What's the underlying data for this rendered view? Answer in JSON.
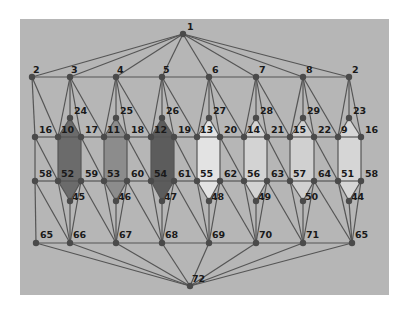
{
  "diagram": {
    "type": "planar-graph",
    "background": {
      "x": 20,
      "y": 19,
      "width": 369,
      "height": 276,
      "color": "#b6b6b6"
    },
    "edge_color": "#555555",
    "node_color": "#4a4a4a",
    "node_radius": 3.2,
    "nodes": [
      {
        "id": "n1",
        "label": "1",
        "x": 183,
        "y": 34,
        "lx": 4,
        "ly": -4
      },
      {
        "id": "n2a",
        "label": "2",
        "x": 32,
        "y": 77,
        "lx": 1,
        "ly": -4
      },
      {
        "id": "n3",
        "label": "3",
        "x": 70,
        "y": 77,
        "lx": 1,
        "ly": -4
      },
      {
        "id": "n4",
        "label": "4",
        "x": 116,
        "y": 77,
        "lx": 1,
        "ly": -4
      },
      {
        "id": "n5",
        "label": "5",
        "x": 162,
        "y": 77,
        "lx": 1,
        "ly": -4
      },
      {
        "id": "n6",
        "label": "6",
        "x": 209,
        "y": 77,
        "lx": 3,
        "ly": -4
      },
      {
        "id": "n7",
        "label": "7",
        "x": 256,
        "y": 77,
        "lx": 3,
        "ly": -4
      },
      {
        "id": "n8",
        "label": "8",
        "x": 303,
        "y": 77,
        "lx": 3,
        "ly": -4
      },
      {
        "id": "n2b",
        "label": "2",
        "x": 349,
        "y": 77,
        "lx": 3,
        "ly": -4
      },
      {
        "id": "n24",
        "label": "24",
        "x": 70,
        "y": 118,
        "lx": 4,
        "ly": -4
      },
      {
        "id": "n25",
        "label": "25",
        "x": 116,
        "y": 118,
        "lx": 4,
        "ly": -4
      },
      {
        "id": "n26",
        "label": "26",
        "x": 162,
        "y": 118,
        "lx": 4,
        "ly": -4
      },
      {
        "id": "n27",
        "label": "27",
        "x": 209,
        "y": 118,
        "lx": 4,
        "ly": -4
      },
      {
        "id": "n28",
        "label": "28",
        "x": 256,
        "y": 118,
        "lx": 4,
        "ly": -4
      },
      {
        "id": "n29",
        "label": "29",
        "x": 303,
        "y": 118,
        "lx": 4,
        "ly": -4
      },
      {
        "id": "n23",
        "label": "23",
        "x": 349,
        "y": 118,
        "lx": 4,
        "ly": -4
      },
      {
        "id": "n16a",
        "label": "16",
        "x": 35,
        "y": 137,
        "lx": 4,
        "ly": -4
      },
      {
        "id": "n10",
        "label": "10",
        "x": 58,
        "y": 137,
        "lx": 3,
        "ly": -4
      },
      {
        "id": "n17",
        "label": "17",
        "x": 81,
        "y": 137,
        "lx": 4,
        "ly": -4
      },
      {
        "id": "n11",
        "label": "11",
        "x": 104,
        "y": 137,
        "lx": 3,
        "ly": -4
      },
      {
        "id": "n18",
        "label": "18",
        "x": 127,
        "y": 137,
        "lx": 4,
        "ly": -4
      },
      {
        "id": "n12",
        "label": "12",
        "x": 151,
        "y": 137,
        "lx": 3,
        "ly": -4
      },
      {
        "id": "n19",
        "label": "19",
        "x": 174,
        "y": 137,
        "lx": 4,
        "ly": -4
      },
      {
        "id": "n13",
        "label": "13",
        "x": 197,
        "y": 137,
        "lx": 3,
        "ly": -4
      },
      {
        "id": "n20",
        "label": "20",
        "x": 220,
        "y": 137,
        "lx": 4,
        "ly": -4
      },
      {
        "id": "n14",
        "label": "14",
        "x": 244,
        "y": 137,
        "lx": 3,
        "ly": -4
      },
      {
        "id": "n21",
        "label": "21",
        "x": 267,
        "y": 137,
        "lx": 4,
        "ly": -4
      },
      {
        "id": "n15",
        "label": "15",
        "x": 290,
        "y": 137,
        "lx": 3,
        "ly": -4
      },
      {
        "id": "n22",
        "label": "22",
        "x": 314,
        "y": 137,
        "lx": 4,
        "ly": -4
      },
      {
        "id": "n9",
        "label": "9",
        "x": 338,
        "y": 137,
        "lx": 3,
        "ly": -4
      },
      {
        "id": "n16b",
        "label": "16",
        "x": 361,
        "y": 137,
        "lx": 4,
        "ly": -4
      },
      {
        "id": "n58a",
        "label": "58",
        "x": 35,
        "y": 181,
        "lx": 4,
        "ly": -4
      },
      {
        "id": "n52",
        "label": "52",
        "x": 58,
        "y": 181,
        "lx": 3,
        "ly": -4
      },
      {
        "id": "n59",
        "label": "59",
        "x": 81,
        "y": 181,
        "lx": 4,
        "ly": -4
      },
      {
        "id": "n53",
        "label": "53",
        "x": 104,
        "y": 181,
        "lx": 3,
        "ly": -4
      },
      {
        "id": "n60",
        "label": "60",
        "x": 127,
        "y": 181,
        "lx": 4,
        "ly": -4
      },
      {
        "id": "n54",
        "label": "54",
        "x": 151,
        "y": 181,
        "lx": 3,
        "ly": -4
      },
      {
        "id": "n61",
        "label": "61",
        "x": 174,
        "y": 181,
        "lx": 4,
        "ly": -4
      },
      {
        "id": "n55",
        "label": "55",
        "x": 197,
        "y": 181,
        "lx": 3,
        "ly": -4
      },
      {
        "id": "n62",
        "label": "62",
        "x": 220,
        "y": 181,
        "lx": 4,
        "ly": -4
      },
      {
        "id": "n56",
        "label": "56",
        "x": 244,
        "y": 181,
        "lx": 3,
        "ly": -4
      },
      {
        "id": "n63",
        "label": "63",
        "x": 267,
        "y": 181,
        "lx": 4,
        "ly": -4
      },
      {
        "id": "n57",
        "label": "57",
        "x": 290,
        "y": 181,
        "lx": 3,
        "ly": -4
      },
      {
        "id": "n64",
        "label": "64",
        "x": 314,
        "y": 181,
        "lx": 4,
        "ly": -4
      },
      {
        "id": "n51",
        "label": "51",
        "x": 338,
        "y": 181,
        "lx": 3,
        "ly": -4
      },
      {
        "id": "n58b",
        "label": "58",
        "x": 361,
        "y": 181,
        "lx": 4,
        "ly": -4
      },
      {
        "id": "n45",
        "label": "45",
        "x": 70,
        "y": 201,
        "lx": 2,
        "ly": -1
      },
      {
        "id": "n46",
        "label": "46",
        "x": 116,
        "y": 201,
        "lx": 2,
        "ly": -1
      },
      {
        "id": "n47",
        "label": "47",
        "x": 162,
        "y": 201,
        "lx": 2,
        "ly": -1
      },
      {
        "id": "n48",
        "label": "48",
        "x": 209,
        "y": 201,
        "lx": 2,
        "ly": -1
      },
      {
        "id": "n49",
        "label": "49",
        "x": 256,
        "y": 201,
        "lx": 2,
        "ly": -1
      },
      {
        "id": "n50",
        "label": "50",
        "x": 303,
        "y": 201,
        "lx": 2,
        "ly": -1
      },
      {
        "id": "n44",
        "label": "44",
        "x": 349,
        "y": 201,
        "lx": 2,
        "ly": -1
      },
      {
        "id": "n65a",
        "label": "65",
        "x": 36,
        "y": 243,
        "lx": 4,
        "ly": -5
      },
      {
        "id": "n66",
        "label": "66",
        "x": 70,
        "y": 243,
        "lx": 3,
        "ly": -5
      },
      {
        "id": "n67",
        "label": "67",
        "x": 116,
        "y": 243,
        "lx": 3,
        "ly": -5
      },
      {
        "id": "n68",
        "label": "68",
        "x": 162,
        "y": 243,
        "lx": 3,
        "ly": -5
      },
      {
        "id": "n69",
        "label": "69",
        "x": 209,
        "y": 243,
        "lx": 3,
        "ly": -5
      },
      {
        "id": "n70",
        "label": "70",
        "x": 256,
        "y": 243,
        "lx": 3,
        "ly": -5
      },
      {
        "id": "n71",
        "label": "71",
        "x": 303,
        "y": 243,
        "lx": 3,
        "ly": -5
      },
      {
        "id": "n65b",
        "label": "65",
        "x": 352,
        "y": 243,
        "lx": 3,
        "ly": -5
      },
      {
        "id": "n72",
        "label": "72",
        "x": 190,
        "y": 286,
        "lx": 2,
        "ly": -4
      }
    ],
    "faces": [
      {
        "label": "face-10-24-17-59-45-52",
        "color": "#6b6b6b",
        "nodes": [
          "n10",
          "n24",
          "n17",
          "n59",
          "n45",
          "n52"
        ]
      },
      {
        "label": "face-11-25-18-60-46-53",
        "color": "#8c8c8c",
        "nodes": [
          "n11",
          "n25",
          "n18",
          "n60",
          "n46",
          "n53"
        ]
      },
      {
        "label": "face-12-26-19-61-47-54",
        "color": "#5c5c5c",
        "nodes": [
          "n12",
          "n26",
          "n19",
          "n61",
          "n47",
          "n54"
        ]
      },
      {
        "label": "face-13-27-20-62-48-55",
        "color": "#e3e3e3",
        "nodes": [
          "n13",
          "n27",
          "n20",
          "n62",
          "n48",
          "n55"
        ]
      },
      {
        "label": "face-14-28-21-63-49-56",
        "color": "#d3d3d3",
        "nodes": [
          "n14",
          "n28",
          "n21",
          "n63",
          "n49",
          "n56"
        ]
      },
      {
        "label": "face-15-29-22-64-50-57",
        "color": "#d0d0d0",
        "nodes": [
          "n15",
          "n29",
          "n22",
          "n64",
          "n50",
          "n57"
        ]
      },
      {
        "label": "face-9-23-16-58-44-51",
        "color": "#d6d6d6",
        "nodes": [
          "n9",
          "n23",
          "n16b",
          "n58b",
          "n44",
          "n51"
        ]
      }
    ],
    "edges": [
      [
        "n1",
        "n2a"
      ],
      [
        "n1",
        "n3"
      ],
      [
        "n1",
        "n4"
      ],
      [
        "n1",
        "n5"
      ],
      [
        "n1",
        "n6"
      ],
      [
        "n1",
        "n7"
      ],
      [
        "n1",
        "n8"
      ],
      [
        "n1",
        "n2b"
      ],
      [
        "n2a",
        "n3"
      ],
      [
        "n3",
        "n4"
      ],
      [
        "n4",
        "n5"
      ],
      [
        "n5",
        "n6"
      ],
      [
        "n6",
        "n7"
      ],
      [
        "n7",
        "n8"
      ],
      [
        "n8",
        "n2b"
      ],
      [
        "n2a",
        "n16a"
      ],
      [
        "n2a",
        "n10"
      ],
      [
        "n3",
        "n10"
      ],
      [
        "n3",
        "n24"
      ],
      [
        "n3",
        "n17"
      ],
      [
        "n3",
        "n11"
      ],
      [
        "n4",
        "n11"
      ],
      [
        "n4",
        "n25"
      ],
      [
        "n4",
        "n18"
      ],
      [
        "n4",
        "n12"
      ],
      [
        "n5",
        "n12"
      ],
      [
        "n5",
        "n26"
      ],
      [
        "n5",
        "n19"
      ],
      [
        "n5",
        "n13"
      ],
      [
        "n6",
        "n13"
      ],
      [
        "n6",
        "n27"
      ],
      [
        "n6",
        "n20"
      ],
      [
        "n6",
        "n14"
      ],
      [
        "n7",
        "n14"
      ],
      [
        "n7",
        "n28"
      ],
      [
        "n7",
        "n21"
      ],
      [
        "n7",
        "n15"
      ],
      [
        "n8",
        "n15"
      ],
      [
        "n8",
        "n29"
      ],
      [
        "n8",
        "n22"
      ],
      [
        "n8",
        "n9"
      ],
      [
        "n2b",
        "n9"
      ],
      [
        "n2b",
        "n23"
      ],
      [
        "n2b",
        "n16b"
      ],
      [
        "n24",
        "n10"
      ],
      [
        "n24",
        "n17"
      ],
      [
        "n25",
        "n11"
      ],
      [
        "n25",
        "n18"
      ],
      [
        "n26",
        "n12"
      ],
      [
        "n26",
        "n19"
      ],
      [
        "n27",
        "n13"
      ],
      [
        "n27",
        "n20"
      ],
      [
        "n28",
        "n14"
      ],
      [
        "n28",
        "n21"
      ],
      [
        "n29",
        "n15"
      ],
      [
        "n29",
        "n22"
      ],
      [
        "n23",
        "n9"
      ],
      [
        "n23",
        "n16b"
      ],
      [
        "n16a",
        "n10"
      ],
      [
        "n10",
        "n17"
      ],
      [
        "n17",
        "n11"
      ],
      [
        "n11",
        "n18"
      ],
      [
        "n18",
        "n12"
      ],
      [
        "n12",
        "n19"
      ],
      [
        "n19",
        "n13"
      ],
      [
        "n13",
        "n20"
      ],
      [
        "n20",
        "n14"
      ],
      [
        "n14",
        "n21"
      ],
      [
        "n21",
        "n15"
      ],
      [
        "n15",
        "n22"
      ],
      [
        "n22",
        "n9"
      ],
      [
        "n9",
        "n16b"
      ],
      [
        "n16a",
        "n58a"
      ],
      [
        "n10",
        "n52"
      ],
      [
        "n17",
        "n59"
      ],
      [
        "n11",
        "n53"
      ],
      [
        "n18",
        "n60"
      ],
      [
        "n12",
        "n54"
      ],
      [
        "n19",
        "n61"
      ],
      [
        "n13",
        "n55"
      ],
      [
        "n20",
        "n62"
      ],
      [
        "n14",
        "n56"
      ],
      [
        "n21",
        "n63"
      ],
      [
        "n15",
        "n57"
      ],
      [
        "n22",
        "n64"
      ],
      [
        "n9",
        "n51"
      ],
      [
        "n16b",
        "n58b"
      ],
      [
        "n16a",
        "n52"
      ],
      [
        "n17",
        "n53"
      ],
      [
        "n18",
        "n54"
      ],
      [
        "n19",
        "n55"
      ],
      [
        "n20",
        "n56"
      ],
      [
        "n21",
        "n57"
      ],
      [
        "n22",
        "n51"
      ],
      [
        "n58a",
        "n52"
      ],
      [
        "n52",
        "n59"
      ],
      [
        "n59",
        "n53"
      ],
      [
        "n53",
        "n60"
      ],
      [
        "n60",
        "n54"
      ],
      [
        "n54",
        "n61"
      ],
      [
        "n61",
        "n55"
      ],
      [
        "n55",
        "n62"
      ],
      [
        "n62",
        "n56"
      ],
      [
        "n56",
        "n63"
      ],
      [
        "n63",
        "n57"
      ],
      [
        "n57",
        "n64"
      ],
      [
        "n64",
        "n51"
      ],
      [
        "n51",
        "n58b"
      ],
      [
        "n52",
        "n45"
      ],
      [
        "n59",
        "n45"
      ],
      [
        "n53",
        "n46"
      ],
      [
        "n60",
        "n46"
      ],
      [
        "n54",
        "n47"
      ],
      [
        "n61",
        "n47"
      ],
      [
        "n55",
        "n48"
      ],
      [
        "n62",
        "n48"
      ],
      [
        "n56",
        "n49"
      ],
      [
        "n63",
        "n49"
      ],
      [
        "n57",
        "n50"
      ],
      [
        "n64",
        "n50"
      ],
      [
        "n51",
        "n44"
      ],
      [
        "n58b",
        "n44"
      ],
      [
        "n58a",
        "n65a"
      ],
      [
        "n58a",
        "n66"
      ],
      [
        "n52",
        "n66"
      ],
      [
        "n45",
        "n66"
      ],
      [
        "n59",
        "n66"
      ],
      [
        "n59",
        "n67"
      ],
      [
        "n53",
        "n67"
      ],
      [
        "n46",
        "n67"
      ],
      [
        "n60",
        "n67"
      ],
      [
        "n60",
        "n68"
      ],
      [
        "n54",
        "n68"
      ],
      [
        "n47",
        "n68"
      ],
      [
        "n61",
        "n68"
      ],
      [
        "n61",
        "n69"
      ],
      [
        "n55",
        "n69"
      ],
      [
        "n48",
        "n69"
      ],
      [
        "n62",
        "n69"
      ],
      [
        "n62",
        "n70"
      ],
      [
        "n56",
        "n70"
      ],
      [
        "n49",
        "n70"
      ],
      [
        "n63",
        "n70"
      ],
      [
        "n63",
        "n71"
      ],
      [
        "n57",
        "n71"
      ],
      [
        "n50",
        "n71"
      ],
      [
        "n64",
        "n71"
      ],
      [
        "n64",
        "n65b"
      ],
      [
        "n51",
        "n65b"
      ],
      [
        "n44",
        "n65b"
      ],
      [
        "n58b",
        "n65b"
      ],
      [
        "n65a",
        "n66"
      ],
      [
        "n66",
        "n67"
      ],
      [
        "n67",
        "n68"
      ],
      [
        "n68",
        "n69"
      ],
      [
        "n69",
        "n70"
      ],
      [
        "n70",
        "n71"
      ],
      [
        "n71",
        "n65b"
      ],
      [
        "n65a",
        "n72"
      ],
      [
        "n66",
        "n72"
      ],
      [
        "n67",
        "n72"
      ],
      [
        "n68",
        "n72"
      ],
      [
        "n69",
        "n72"
      ],
      [
        "n70",
        "n72"
      ],
      [
        "n71",
        "n72"
      ],
      [
        "n65b",
        "n72"
      ]
    ]
  }
}
